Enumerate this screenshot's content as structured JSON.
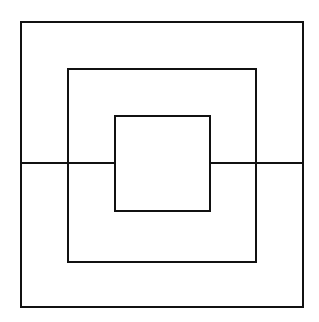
{
  "diagram": {
    "type": "nested-squares",
    "stroke_color": "#111111",
    "background": "#ffffff",
    "stroke_width": 2,
    "squares": [
      {
        "name": "outer",
        "x": 21,
        "y": 22,
        "w": 282,
        "h": 285
      },
      {
        "name": "middle",
        "x": 68,
        "y": 69,
        "w": 188,
        "h": 193
      },
      {
        "name": "inner",
        "x": 115,
        "y": 116,
        "w": 95,
        "h": 95
      }
    ],
    "horizontal_line_y": 163
  }
}
